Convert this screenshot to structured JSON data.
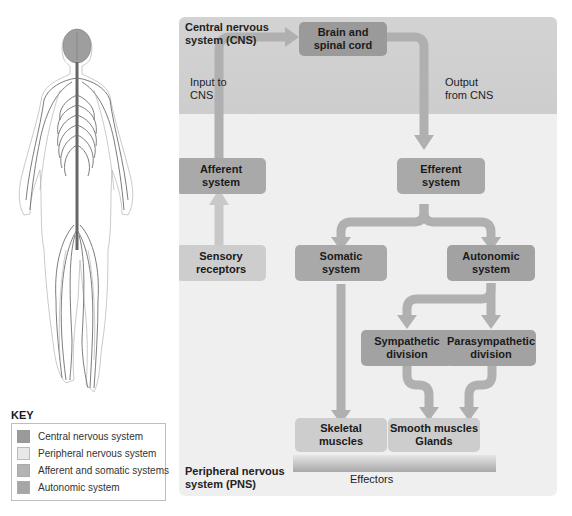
{
  "diagram": {
    "cns_region_label": "Central nervous system (CNS)",
    "pns_region_label": "Peripheral nervous system (PNS)",
    "input_label": "Input to CNS",
    "output_label": "Output from CNS",
    "effectors_label": "Effectors",
    "nodes": {
      "brain": "Brain and\nspinal cord",
      "afferent": "Afferent\nsystem",
      "efferent": "Efferent\nsystem",
      "sensory": "Sensory\nreceptors",
      "somatic": "Somatic\nsystem",
      "autonomic": "Autonomic\nsystem",
      "sympathetic": "Sympathetic\ndivision",
      "parasympathetic": "Parasympathetic\ndivision",
      "skeletal": "Skeletal\nmuscles",
      "smooth": "Smooth muscles\nGlands"
    },
    "edges": [
      [
        "Sensory receptors",
        "Afferent system"
      ],
      [
        "Afferent system",
        "Brain and spinal cord"
      ],
      [
        "Brain and spinal cord",
        "Efferent system"
      ],
      [
        "Efferent system",
        "Somatic system"
      ],
      [
        "Efferent system",
        "Autonomic system"
      ],
      [
        "Somatic system",
        "Skeletal muscles"
      ],
      [
        "Autonomic system",
        "Sympathetic division"
      ],
      [
        "Autonomic system",
        "Parasympathetic division"
      ],
      [
        "Sympathetic division",
        "Smooth muscles Glands"
      ],
      [
        "Parasympathetic division",
        "Smooth muscles Glands"
      ]
    ]
  },
  "key": {
    "title": "KEY",
    "items": [
      {
        "label": "Central nervous system",
        "color": "#9a9a9a"
      },
      {
        "label": "Peripheral nervous system",
        "color": "#e8e8e8"
      },
      {
        "label": "Afferent and somatic systems",
        "color": "#b3b3b3"
      },
      {
        "label": "Autonomic system",
        "color": "#a6a6a6"
      }
    ]
  },
  "colors": {
    "panel_bg": "#efefef",
    "cns_band": "#d1d1d1",
    "cns_box": "#9a9a9a",
    "arrow": "#b0b0b0"
  }
}
